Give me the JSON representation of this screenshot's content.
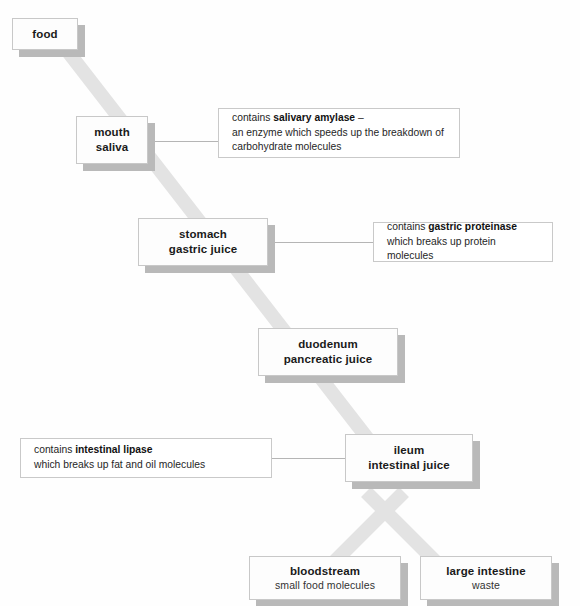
{
  "diagram": {
    "colors": {
      "flow_band": "#e3e3e3",
      "box_shadow": "#b9b9b9",
      "box_border": "#c8c8c8",
      "connector_line": "#b5b5b5",
      "background": "#fefefe",
      "text": "#1a1a1a"
    },
    "stages": [
      {
        "id": "food",
        "line1": "food",
        "line2": ""
      },
      {
        "id": "mouth",
        "line1": "mouth",
        "line2": "saliva"
      },
      {
        "id": "stomach",
        "line1": "stomach",
        "line2": "gastric juice"
      },
      {
        "id": "duodenum",
        "line1": "duodenum",
        "line2": "pancreatic juice"
      },
      {
        "id": "ileum",
        "line1": "ileum",
        "line2": "intestinal juice"
      },
      {
        "id": "bloodstream",
        "line1": "bloodstream",
        "line2": "small food molecules"
      },
      {
        "id": "large-intestine",
        "line1": "large intestine",
        "line2": "waste"
      }
    ],
    "notes": [
      {
        "id": "salivary-amylase",
        "lines": [
          {
            "pre": "contains ",
            "bold": "salivary amylase",
            "post": " –"
          },
          {
            "pre": "an enzyme which speeds up the breakdown of",
            "bold": "",
            "post": ""
          },
          {
            "pre": "carbohydrate molecules",
            "bold": "",
            "post": ""
          }
        ]
      },
      {
        "id": "gastric-proteinase",
        "lines": [
          {
            "pre": "contains ",
            "bold": "gastric proteinase",
            "post": ""
          },
          {
            "pre": "which breaks up protein molecules",
            "bold": "",
            "post": ""
          }
        ]
      },
      {
        "id": "intestinal-lipase",
        "lines": [
          {
            "pre": "contains ",
            "bold": "intestinal lipase",
            "post": ""
          },
          {
            "pre": "which breaks up fat and oil molecules",
            "bold": "",
            "post": ""
          }
        ]
      }
    ]
  }
}
